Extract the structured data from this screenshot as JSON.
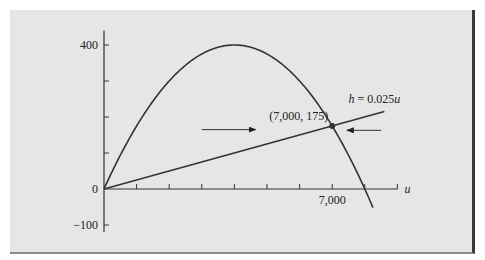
{
  "chart_data": {
    "type": "line",
    "title": "",
    "xlabel": "u",
    "ylabel": "",
    "xlim": [
      0,
      9000
    ],
    "ylim": [
      -100,
      440
    ],
    "x_ticks": [
      0,
      1000,
      2000,
      3000,
      4000,
      5000,
      6000,
      7000,
      8000,
      9000
    ],
    "x_tick_labels": [
      {
        "value": 7000,
        "label": "7,000"
      }
    ],
    "y_ticks": [
      -100,
      0,
      100,
      200,
      300,
      400
    ],
    "y_tick_labels": [
      {
        "value": 400,
        "label": "400"
      },
      {
        "value": 0,
        "label": "0"
      },
      {
        "value": -100,
        "label": "−100"
      }
    ],
    "series": [
      {
        "name": "parabola",
        "equation": "h = 0.2u - 0.000025u^2",
        "coef": {
          "a": -2.5e-05,
          "b": 0.2,
          "c": 0
        },
        "u_range": [
          0,
          8250
        ]
      },
      {
        "name": "line",
        "label": "h = 0.025u",
        "label_parts": {
          "var_h": "h",
          "eq": " = 0.025",
          "var_u": "u"
        },
        "slope": 0.025,
        "u_range": [
          0,
          8600
        ]
      }
    ],
    "annotations": {
      "intersection": {
        "u": 7000,
        "h": 175,
        "label": "(7,000, 175)"
      },
      "arrows": [
        {
          "direction": "right",
          "from_u": 3000,
          "to_u": 4650,
          "h": 165
        },
        {
          "direction": "left",
          "from_u": 8500,
          "to_u": 7450,
          "h": 163
        }
      ]
    },
    "grid": false,
    "legend": "none"
  }
}
